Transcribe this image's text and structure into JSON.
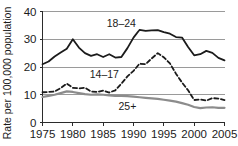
{
  "chart_data": {
    "type": "line",
    "title": "",
    "xlabel": "",
    "ylabel": "Rate per 100,000 population",
    "xlim": [
      1975,
      2005
    ],
    "ylim": [
      0,
      40
    ],
    "xticks": [
      1975,
      1980,
      1985,
      1990,
      1995,
      2000,
      2005
    ],
    "yticks": [
      0,
      10,
      20,
      30,
      40
    ],
    "xtick_labels": [
      "1975",
      "1980",
      "1985",
      "1990",
      "1995",
      "2000",
      "2005"
    ],
    "ytick_labels": [
      "0",
      "10",
      "20",
      "30",
      "40"
    ],
    "grid": true,
    "grid_axis": "y",
    "legend": "inline-annotations",
    "x": [
      1975,
      1976,
      1977,
      1978,
      1979,
      1980,
      1981,
      1982,
      1983,
      1984,
      1985,
      1986,
      1987,
      1988,
      1989,
      1990,
      1991,
      1992,
      1993,
      1994,
      1995,
      1996,
      1997,
      1998,
      1999,
      2000,
      2001,
      2002,
      2003,
      2004,
      2005
    ],
    "series": [
      {
        "name": "18–24",
        "label": "18–24",
        "color": "#1b1b1b",
        "style": "solid",
        "width": 1.8,
        "label_x": 1988.0,
        "label_y": 35.6,
        "values": [
          21.0,
          22.0,
          23.8,
          25.2,
          26.6,
          30.0,
          27.0,
          25.0,
          24.0,
          24.6,
          23.6,
          24.6,
          23.4,
          23.6,
          26.8,
          30.6,
          33.4,
          33.0,
          33.2,
          33.3,
          32.6,
          32.0,
          30.8,
          30.6,
          27.2,
          24.2,
          24.6,
          25.8,
          25.1,
          23.3,
          22.4
        ]
      },
      {
        "name": "14–17",
        "label": "14–17",
        "color": "#1b1b1b",
        "style": "dashed",
        "width": 1.8,
        "label_x": 1985.2,
        "label_y": 17.4,
        "values": [
          10.9,
          11.0,
          11.2,
          12.4,
          14.0,
          12.5,
          12.3,
          12.5,
          11.2,
          11.0,
          11.5,
          10.8,
          11.6,
          14.0,
          16.6,
          18.6,
          21.2,
          21.0,
          23.1,
          25.0,
          23.5,
          21.3,
          17.6,
          14.4,
          11.6,
          8.1,
          8.3,
          7.9,
          8.8,
          8.6,
          8.1
        ]
      },
      {
        "name": "25+",
        "label": "25+",
        "color": "#8c8c8c",
        "style": "solid",
        "width": 2.2,
        "label_x": 1989.0,
        "label_y": 5.6,
        "values": [
          9.2,
          9.6,
          10.0,
          10.6,
          11.2,
          11.0,
          10.6,
          10.2,
          10.0,
          10.1,
          10.0,
          9.8,
          9.6,
          9.6,
          9.5,
          9.3,
          9.1,
          8.9,
          8.7,
          8.5,
          8.2,
          7.9,
          7.5,
          7.0,
          6.4,
          5.6,
          5.2,
          5.4,
          5.5,
          5.3,
          5.3
        ]
      }
    ]
  },
  "axis": {
    "y_title": "Rate per 100,000 population"
  }
}
